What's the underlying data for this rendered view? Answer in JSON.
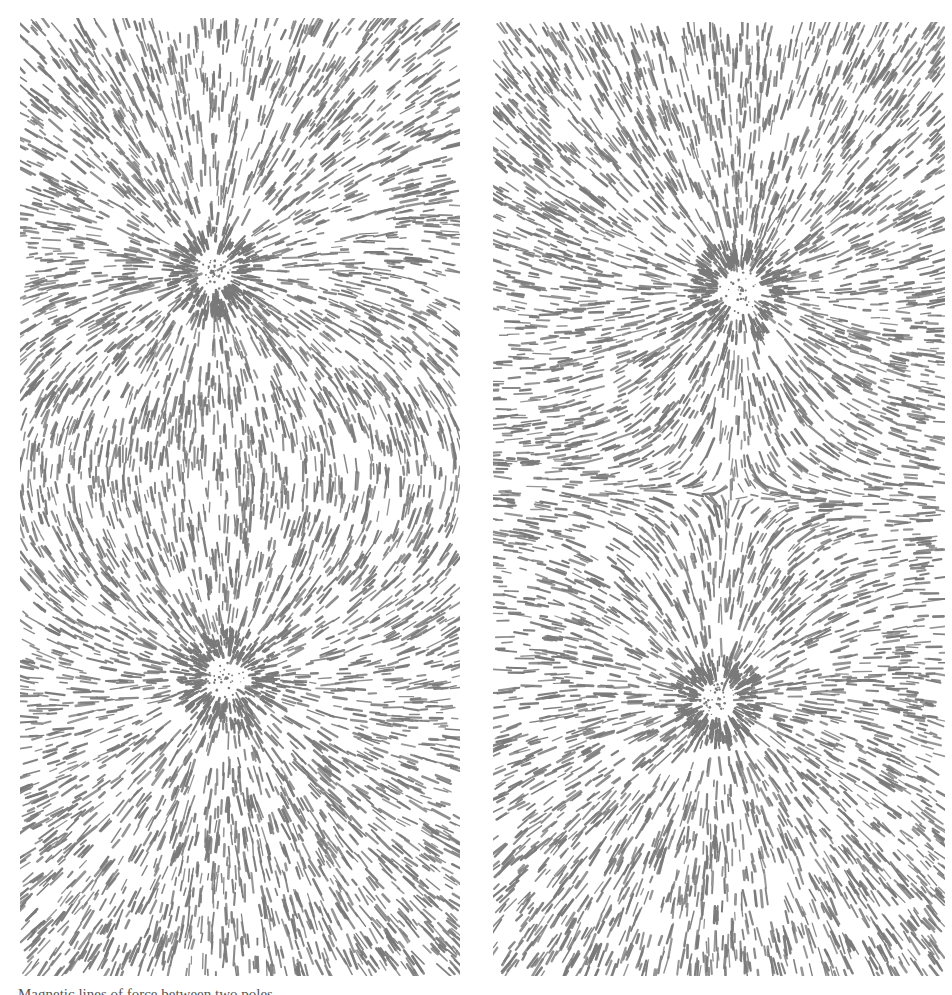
{
  "figure": {
    "ink_color": "#7a7a7a",
    "background_color": "#ffffff",
    "panels": [
      {
        "id": "left",
        "label": "Two opposite (unlike) poles - field lines connect between poles",
        "configuration": "unlike",
        "poles": [
          {
            "cx": 193,
            "cy": 254,
            "ring_radius": 42
          },
          {
            "cx": 206,
            "cy": 660,
            "ring_radius": 46
          }
        ]
      },
      {
        "id": "right",
        "label": "Two like poles - field lines repel, neutral point between",
        "configuration": "like",
        "poles": [
          {
            "cx": 247,
            "cy": 268,
            "ring_radius": 46
          },
          {
            "cx": 225,
            "cy": 678,
            "ring_radius": 40
          }
        ],
        "neutral_point": {
          "cx": 230,
          "cy": 472
        }
      }
    ],
    "caption": "Magnetic lines of force between two poles"
  }
}
